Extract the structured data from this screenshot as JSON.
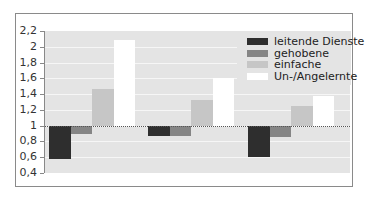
{
  "chart_data": {
    "type": "bar",
    "title": "",
    "xlabel": "",
    "ylabel": "",
    "ylim": [
      0.4,
      2.2
    ],
    "baseline": 1.0,
    "grid": true,
    "legend_position": "top-right inside",
    "yticks": [
      "2,2",
      "2",
      "1,8",
      "1,6",
      "1,4",
      "1,2",
      "1",
      "0,8",
      "0,6",
      "0,4"
    ],
    "categories": [
      "Gruppe 1",
      "Gruppe 2",
      "Gruppe 3"
    ],
    "series": [
      {
        "name": "leitende Dienste",
        "color": "#2e2e2e",
        "values": [
          0.58,
          0.87,
          0.6
        ]
      },
      {
        "name": "gehobene",
        "color": "#858585",
        "values": [
          0.89,
          0.87,
          0.85
        ]
      },
      {
        "name": "einfache",
        "color": "#c6c6c6",
        "values": [
          1.46,
          1.32,
          1.25
        ]
      },
      {
        "name": "Un-/Angelernte",
        "color": "#ffffff",
        "values": [
          2.09,
          1.61,
          1.38
        ]
      }
    ]
  },
  "legend": {
    "items": [
      {
        "label": "leitende Dienste",
        "color": "#2e2e2e"
      },
      {
        "label": "gehobene",
        "color": "#858585"
      },
      {
        "label": "einfache",
        "color": "#c6c6c6"
      },
      {
        "label": "Un-/Angelernte",
        "color": "#ffffff"
      }
    ]
  },
  "colors": {
    "plot_background": "#e4e4e4",
    "gridline": "#f6f6f6",
    "frame": "#8a8a8a"
  }
}
